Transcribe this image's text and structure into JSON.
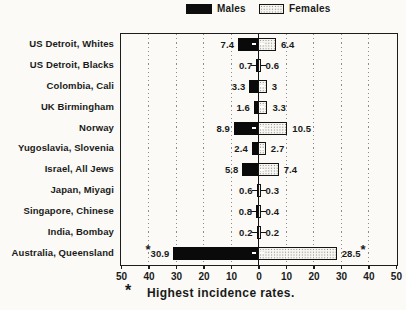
{
  "legend": {
    "males_label": "Males",
    "females_label": "Females"
  },
  "footnote": {
    "symbol": "*",
    "text": "Highest incidence rates."
  },
  "chart_data": {
    "type": "bar",
    "orientation": "horizontal-diverging",
    "title": "",
    "categories": [
      "US Detroit, Whites",
      "US Detroit, Blacks",
      "Colombia, Cali",
      "UK Birmingham",
      "Norway",
      "Yugoslavia, Slovenia",
      "Israel, All Jews",
      "Japan, Miyagi",
      "Singapore, Chinese",
      "India, Bombay",
      "Australia, Queensland"
    ],
    "series": [
      {
        "name": "Males",
        "values": [
          7.4,
          0.7,
          3.3,
          1.6,
          8.9,
          2.4,
          5.8,
          0.6,
          0.8,
          0.2,
          30.9
        ],
        "labels": [
          "7.4",
          "0.7",
          "3.3",
          "1.6",
          "8.9",
          "2.4",
          "5.8",
          "0.6",
          "0.8",
          "0.2",
          "30.9"
        ]
      },
      {
        "name": "Females",
        "values": [
          6.4,
          0.6,
          3.0,
          3.3,
          10.5,
          2.7,
          7.4,
          0.3,
          0.4,
          0.2,
          28.5
        ],
        "labels": [
          "6.4",
          "0.6",
          "3",
          "3.3",
          "10.5",
          "2.7",
          "7.4",
          "0.3",
          "0.4",
          "0.2",
          "28.5"
        ]
      }
    ],
    "starred_category": "Australia, Queensland",
    "star_symbol": "*",
    "star_note": "Highest incidence rates.",
    "axis_ticks": [
      "50",
      "40",
      "30",
      "20",
      "10",
      "0",
      "10",
      "20",
      "30",
      "40",
      "50"
    ],
    "xlim": [
      -50,
      50
    ],
    "gridlines": "dotted vertical every 10 units",
    "legend_position": "top-center",
    "colors": {
      "male_bar": "#0a0a0a",
      "female_bar": "stipple-pattern",
      "background": "#fbfaf6",
      "ink": "#1a1a1a"
    }
  }
}
